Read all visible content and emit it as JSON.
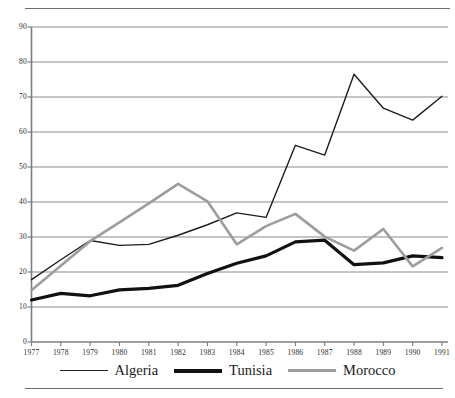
{
  "chart_data": {
    "type": "line",
    "title": "",
    "subtitle": "",
    "xlabel": "",
    "ylabel": "",
    "categories": [
      "1977",
      "1978",
      "1979",
      "1980",
      "1981",
      "1982",
      "1983",
      "1984",
      "1985",
      "1986",
      "1987",
      "1988",
      "1989",
      "1990",
      "1991"
    ],
    "x": [
      1977,
      1978,
      1979,
      1980,
      1981,
      1982,
      1983,
      1984,
      1985,
      1986,
      1987,
      1988,
      1989,
      1990,
      1991
    ],
    "xlim": [
      1977,
      1991
    ],
    "ylim": [
      0,
      90
    ],
    "yticks": [
      0,
      10,
      20,
      30,
      40,
      50,
      60,
      70,
      80,
      90
    ],
    "ytick_labels": [
      "0",
      "10",
      "20",
      "30",
      "40",
      "50",
      "60",
      "70",
      "80",
      "90"
    ],
    "xtick_labels": [
      "1977",
      "1978",
      "1979",
      "1980",
      "1981",
      "1982",
      "1983",
      "1984",
      "1985",
      "1986",
      "1987",
      "1988",
      "1989",
      "1990",
      "1991"
    ],
    "grid": true,
    "grid_axis": "y",
    "legend_position": "bottom",
    "series": [
      {
        "name": "Algeria",
        "color": "#1d1d1d",
        "line_width": 1.4,
        "values": [
          17.8,
          23.5,
          29.0,
          27.6,
          27.9,
          30.5,
          33.5,
          36.9,
          35.6,
          56.2,
          53.4,
          76.5,
          66.8,
          63.4,
          70.2
        ]
      },
      {
        "name": "Tunisia",
        "color": "#111111",
        "line_width": 3.2,
        "values": [
          12.0,
          13.9,
          13.2,
          14.9,
          15.3,
          16.2,
          19.6,
          22.5,
          24.6,
          28.6,
          29.1,
          22.1,
          22.6,
          24.6,
          24.1
        ]
      },
      {
        "name": "Morocco",
        "color": "#9d9d9d",
        "line_width": 2.6,
        "values": [
          14.8,
          21.8,
          28.8,
          34.2,
          39.6,
          45.2,
          40.2,
          27.9,
          33.1,
          36.6,
          30.1,
          26.1,
          32.3,
          21.6,
          26.9
        ]
      }
    ]
  },
  "legend": {
    "entries": [
      {
        "label": "Algeria",
        "swatch": "thin-black-line-swatch"
      },
      {
        "label": "Tunisia",
        "swatch": "thick-black-line-swatch"
      },
      {
        "label": "Morocco",
        "swatch": "gray-line-swatch"
      }
    ]
  },
  "rules": {
    "top": "top-horizontal-rule",
    "bottom": "bottom-horizontal-rule"
  }
}
